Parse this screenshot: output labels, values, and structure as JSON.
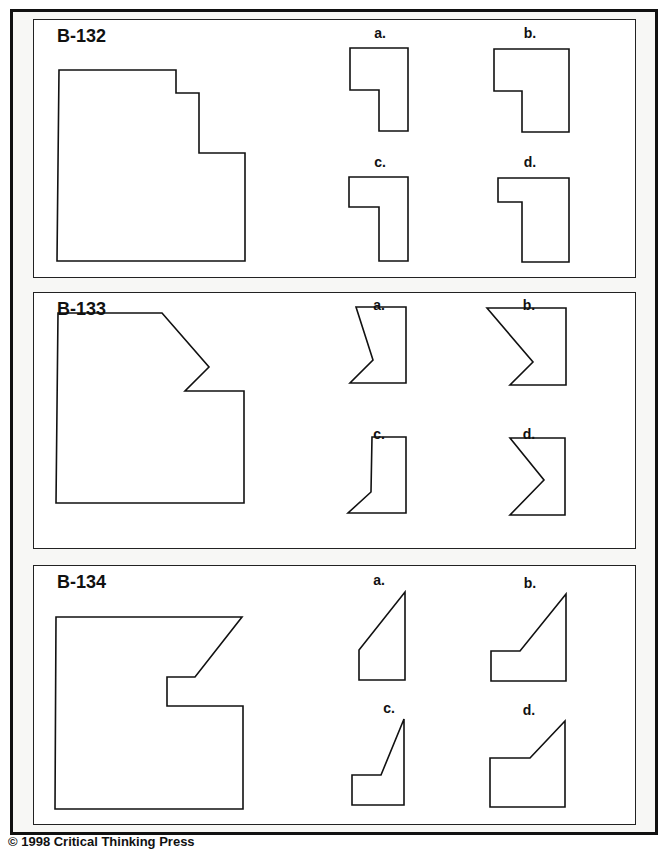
{
  "document": {
    "footer": "© 1998 Critical Thinking Press"
  },
  "problems": [
    {
      "id": "B-132",
      "options": [
        {
          "label": "a."
        },
        {
          "label": "b."
        },
        {
          "label": "c."
        },
        {
          "label": "d."
        }
      ]
    },
    {
      "id": "B-133",
      "options": [
        {
          "label": "a."
        },
        {
          "label": "b."
        },
        {
          "label": "c."
        },
        {
          "label": "d."
        }
      ]
    },
    {
      "id": "B-134",
      "options": [
        {
          "label": "a."
        },
        {
          "label": "b."
        },
        {
          "label": "c."
        },
        {
          "label": "d."
        }
      ]
    }
  ],
  "colors": {
    "ink": "#111111",
    "page_bg": "#f7f7f5",
    "panel_bg": "#ffffff"
  }
}
